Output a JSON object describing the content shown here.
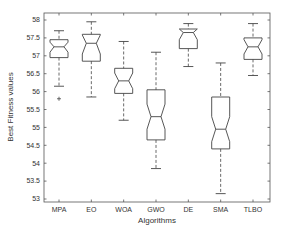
{
  "chart_data": {
    "type": "boxplot",
    "notched": true,
    "title": "",
    "xlabel": "Algorithms",
    "ylabel": "Best Fitness values",
    "ylim": [
      53,
      58
    ],
    "yticks": [
      53,
      53.5,
      54,
      54.5,
      55,
      55.5,
      56,
      56.5,
      57,
      57.5,
      58
    ],
    "ytick_labels": [
      "53",
      "53.5",
      "54",
      "54.5",
      "55",
      "55.5",
      "56",
      "56.5",
      "57",
      "57.5",
      "58"
    ],
    "grid": false,
    "legend": null,
    "categories": [
      "MPA",
      "EO",
      "WOA",
      "GWO",
      "DE",
      "SMA",
      "TLBO"
    ],
    "series": [
      {
        "name": "MPA",
        "whisker_low": 56.15,
        "q1": 56.95,
        "median": 57.25,
        "q3": 57.45,
        "whisker_high": 57.7,
        "notch_low": 57.1,
        "notch_high": 57.38,
        "outliers": [
          55.8
        ]
      },
      {
        "name": "EO",
        "whisker_low": 55.85,
        "q1": 56.85,
        "median": 57.35,
        "q3": 57.6,
        "whisker_high": 57.95,
        "notch_low": 57.05,
        "notch_high": 57.58,
        "outliers": []
      },
      {
        "name": "WOA",
        "whisker_low": 55.2,
        "q1": 55.95,
        "median": 56.3,
        "q3": 56.65,
        "whisker_high": 57.4,
        "notch_low": 56.08,
        "notch_high": 56.52,
        "outliers": []
      },
      {
        "name": "GWO",
        "whisker_low": 53.85,
        "q1": 54.65,
        "median": 55.3,
        "q3": 56.05,
        "whisker_high": 57.1,
        "notch_low": 54.95,
        "notch_high": 55.65,
        "outliers": []
      },
      {
        "name": "DE",
        "whisker_low": 56.7,
        "q1": 57.2,
        "median": 57.65,
        "q3": 57.75,
        "whisker_high": 57.9,
        "notch_low": 57.45,
        "notch_high": 57.85,
        "outliers": []
      },
      {
        "name": "SMA",
        "whisker_low": 53.15,
        "q1": 54.4,
        "median": 54.95,
        "q3": 55.85,
        "whisker_high": 56.8,
        "notch_low": 54.6,
        "notch_high": 55.3,
        "outliers": []
      },
      {
        "name": "TLBO",
        "whisker_low": 56.45,
        "q1": 56.9,
        "median": 57.25,
        "q3": 57.5,
        "whisker_high": 57.9,
        "notch_low": 57.05,
        "notch_high": 57.45,
        "outliers": []
      }
    ]
  },
  "style": {
    "line_color": "#444444",
    "axis_color": "#555555",
    "background": "#ffffff"
  }
}
